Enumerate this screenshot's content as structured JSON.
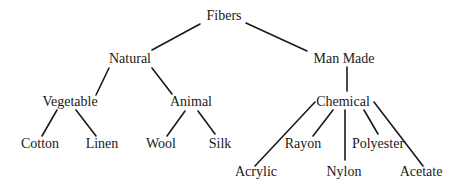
{
  "diagram": {
    "type": "tree",
    "title": "Fibers",
    "nodes": [
      {
        "id": "fibers",
        "label": "Fibers",
        "x": 224,
        "y": 16
      },
      {
        "id": "natural",
        "label": "Natural",
        "x": 130,
        "y": 59
      },
      {
        "id": "man-made",
        "label": "Man Made",
        "x": 344,
        "y": 59
      },
      {
        "id": "vegetable",
        "label": "Vegetable",
        "x": 70,
        "y": 102
      },
      {
        "id": "animal",
        "label": "Animal",
        "x": 191,
        "y": 102
      },
      {
        "id": "chemical",
        "label": "Chemical",
        "x": 343,
        "y": 102
      },
      {
        "id": "cotton",
        "label": "Cotton",
        "x": 40,
        "y": 144
      },
      {
        "id": "linen",
        "label": "Linen",
        "x": 102,
        "y": 144
      },
      {
        "id": "wool",
        "label": "Wool",
        "x": 161,
        "y": 144
      },
      {
        "id": "silk",
        "label": "Silk",
        "x": 220,
        "y": 144
      },
      {
        "id": "rayon",
        "label": "Rayon",
        "x": 303,
        "y": 144
      },
      {
        "id": "polyester",
        "label": "Polyester",
        "x": 378,
        "y": 144
      },
      {
        "id": "acrylic",
        "label": "Acrylic",
        "x": 256,
        "y": 172
      },
      {
        "id": "nylon",
        "label": "Nylon",
        "x": 344,
        "y": 172
      },
      {
        "id": "acetate",
        "label": "Acetate",
        "x": 421,
        "y": 172
      }
    ],
    "edges": [
      {
        "from": "fibers",
        "to": "natural",
        "x1": 200,
        "y1": 24,
        "x2": 152,
        "y2": 50
      },
      {
        "from": "fibers",
        "to": "man-made",
        "x1": 246,
        "y1": 23,
        "x2": 307,
        "y2": 51
      },
      {
        "from": "natural",
        "to": "vegetable",
        "x1": 109,
        "y1": 68,
        "x2": 96,
        "y2": 95
      },
      {
        "from": "natural",
        "to": "animal",
        "x1": 152,
        "y1": 68,
        "x2": 172,
        "y2": 94
      },
      {
        "from": "man-made",
        "to": "chemical",
        "x1": 347,
        "y1": 67,
        "x2": 347,
        "y2": 91
      },
      {
        "from": "vegetable",
        "to": "cotton",
        "x1": 57,
        "y1": 110,
        "x2": 42,
        "y2": 136
      },
      {
        "from": "vegetable",
        "to": "linen",
        "x1": 76,
        "y1": 110,
        "x2": 96,
        "y2": 136
      },
      {
        "from": "animal",
        "to": "wool",
        "x1": 185,
        "y1": 111,
        "x2": 167,
        "y2": 136
      },
      {
        "from": "animal",
        "to": "silk",
        "x1": 198,
        "y1": 111,
        "x2": 215,
        "y2": 134
      },
      {
        "from": "chemical",
        "to": "acrylic",
        "x1": 315,
        "y1": 102,
        "x2": 255,
        "y2": 166
      },
      {
        "from": "chemical",
        "to": "rayon",
        "x1": 333,
        "y1": 110,
        "x2": 313,
        "y2": 136
      },
      {
        "from": "chemical",
        "to": "nylon",
        "x1": 345,
        "y1": 110,
        "x2": 345,
        "y2": 160
      },
      {
        "from": "chemical",
        "to": "polyester",
        "x1": 364,
        "y1": 110,
        "x2": 378,
        "y2": 134
      },
      {
        "from": "chemical",
        "to": "acetate",
        "x1": 374,
        "y1": 102,
        "x2": 423,
        "y2": 166
      }
    ],
    "colors": {
      "line": "#1a1a1a",
      "text": "#1a1a1a",
      "background": "#ffffff"
    }
  }
}
